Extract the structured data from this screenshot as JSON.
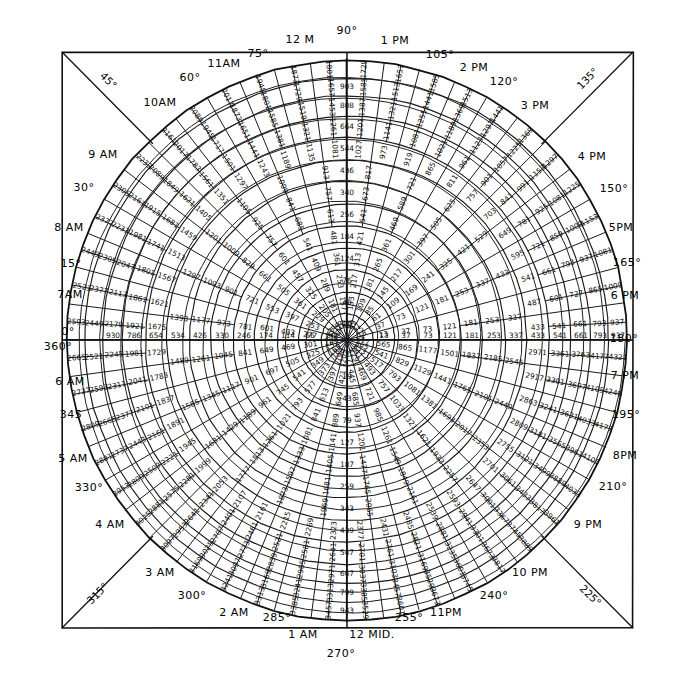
{
  "figure": {
    "kind": "polar-number-grid",
    "background_color": "#ffffff",
    "ink_color": "#111111"
  },
  "geometry": {
    "frame": {
      "x": 62,
      "y": 52,
      "width": 571,
      "height": 576
    },
    "center": {
      "x": 347,
      "y": 340
    },
    "outer_radius": 280,
    "ring_count": 13,
    "spoke_count": 24,
    "degrees_per_spoke": 15
  },
  "chart_data": {
    "type": "polar-grid",
    "angle_unit": "degrees",
    "angles_deg": [
      0,
      15,
      30,
      45,
      60,
      75,
      90,
      105,
      120,
      135,
      150,
      165,
      180,
      195,
      210,
      225,
      240,
      255,
      270,
      285,
      300,
      315,
      330,
      345
    ],
    "ring_radii": [
      26,
      48,
      70,
      92,
      114,
      136,
      158,
      180,
      202,
      224,
      244,
      262,
      280
    ],
    "ray_0deg_values": [
      1,
      13,
      37,
      73,
      121,
      181,
      253,
      337,
      433,
      541,
      661,
      793,
      937
    ],
    "ray_90deg_values": [
      16,
      40,
      76,
      124,
      184,
      256,
      340,
      436,
      544,
      664,
      808,
      903
    ],
    "ray_180deg_values": [
      30,
      66,
      114,
      174,
      246,
      330,
      426,
      534,
      654,
      786,
      930
    ],
    "ray_270deg_values": [
      7,
      19,
      43,
      79,
      127,
      187,
      259,
      343,
      439,
      547,
      667,
      799,
      943
    ],
    "ring_increment_sequence": [
      12,
      24,
      36,
      48,
      60,
      72,
      84,
      96,
      108,
      120,
      132,
      144
    ]
  },
  "edge_labels": {
    "top": [
      {
        "text": "12 M",
        "x": 300,
        "y": 40
      },
      {
        "text": "90°",
        "x": 347,
        "y": 31
      },
      {
        "text": "1 PM",
        "x": 395,
        "y": 41
      },
      {
        "text": "105°",
        "x": 440,
        "y": 55
      },
      {
        "text": "75°",
        "x": 258,
        "y": 54
      },
      {
        "text": "11AM",
        "x": 224,
        "y": 64
      },
      {
        "text": "2 PM",
        "x": 474,
        "y": 68
      },
      {
        "text": "60°",
        "x": 190,
        "y": 78
      },
      {
        "text": "120°",
        "x": 504,
        "y": 82
      },
      {
        "text": "10AM",
        "x": 160,
        "y": 103
      },
      {
        "text": "3 PM",
        "x": 535,
        "y": 106
      },
      {
        "text": "9 AM",
        "x": 103,
        "y": 155
      },
      {
        "text": "4 PM",
        "x": 592,
        "y": 157
      }
    ],
    "left": [
      {
        "text": "30°",
        "x": 84,
        "y": 188
      },
      {
        "text": "8 AM",
        "x": 69,
        "y": 228
      },
      {
        "text": "15°",
        "x": 71,
        "y": 264
      },
      {
        "text": "7AM",
        "x": 70,
        "y": 295
      },
      {
        "text": "0°",
        "x": 68,
        "y": 332
      },
      {
        "text": "360°",
        "x": 58,
        "y": 347
      },
      {
        "text": "6 AM",
        "x": 70,
        "y": 382
      },
      {
        "text": "345",
        "x": 71,
        "y": 415
      },
      {
        "text": "5 AM",
        "x": 73,
        "y": 459
      },
      {
        "text": "330°",
        "x": 89,
        "y": 488
      },
      {
        "text": "4 AM",
        "x": 110,
        "y": 525
      }
    ],
    "right": [
      {
        "text": "150°",
        "x": 614,
        "y": 189
      },
      {
        "text": "5PM",
        "x": 621,
        "y": 228
      },
      {
        "text": "165°",
        "x": 627,
        "y": 263
      },
      {
        "text": "6 PM",
        "x": 625,
        "y": 296
      },
      {
        "text": "180°",
        "x": 624,
        "y": 339
      },
      {
        "text": "7 PM",
        "x": 625,
        "y": 376
      },
      {
        "text": "195°",
        "x": 626,
        "y": 415
      },
      {
        "text": "8PM",
        "x": 625,
        "y": 456
      },
      {
        "text": "210°",
        "x": 613,
        "y": 487
      },
      {
        "text": "9 PM",
        "x": 588,
        "y": 525
      }
    ],
    "bottom": [
      {
        "text": "10 PM",
        "x": 530,
        "y": 573
      },
      {
        "text": "3 AM",
        "x": 160,
        "y": 573
      },
      {
        "text": "240°",
        "x": 494,
        "y": 596
      },
      {
        "text": "300°",
        "x": 192,
        "y": 596
      },
      {
        "text": "11PM",
        "x": 446,
        "y": 613
      },
      {
        "text": "255°",
        "x": 409,
        "y": 618
      },
      {
        "text": "2 AM",
        "x": 234,
        "y": 613
      },
      {
        "text": "285°",
        "x": 277,
        "y": 618
      },
      {
        "text": "12 MID.",
        "x": 372,
        "y": 635
      },
      {
        "text": "1 AM",
        "x": 303,
        "y": 635
      },
      {
        "text": "270°",
        "x": 341,
        "y": 654
      }
    ],
    "corners": [
      {
        "text": "45°",
        "x": 108,
        "y": 81,
        "rotate": 45
      },
      {
        "text": "135°",
        "x": 588,
        "y": 79,
        "rotate": -45
      },
      {
        "text": "315°",
        "x": 98,
        "y": 594,
        "rotate": -45
      },
      {
        "text": "225°",
        "x": 590,
        "y": 596,
        "rotate": 45
      }
    ]
  }
}
